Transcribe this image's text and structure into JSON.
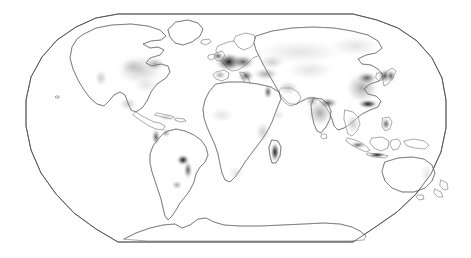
{
  "figure": {
    "type": "map",
    "title": "",
    "subtitle": "",
    "caption": "",
    "projection": "Robinson",
    "width": 471,
    "height": 258,
    "background_color": "#ffffff",
    "has_legend": false,
    "has_graticule": false,
    "has_labels": false,
    "has_title_text": false
  },
  "map": {
    "name": "world-density-map",
    "frame": {
      "stroke_color": "#4a4a4a",
      "stroke_width": 0.7,
      "fill_color": "#ffffff",
      "left_px": 24,
      "right_px": 447,
      "top_px": 14,
      "bottom_px": 242,
      "top_edge_left_px": 118,
      "top_edge_right_px": 353
    },
    "coastline": {
      "stroke_color": "#555555",
      "stroke_width": 0.55,
      "fill_color": "#ffffff"
    },
    "shading": {
      "description": "grayscale population density",
      "scale_low_color": "#e8e8e8",
      "scale_mid_color": "#b4b4b4",
      "scale_high_color": "#6e6e6e",
      "scale_max_color": "#1c1c1c"
    }
  },
  "density_regions": [
    {
      "name": "eastern-north-america",
      "level": "medium",
      "tone": "#c9c9c9"
    },
    {
      "name": "us-northeast-corridor",
      "level": "high",
      "tone": "#9a9a9a"
    },
    {
      "name": "california-coast",
      "level": "medium",
      "tone": "#cfcfcf"
    },
    {
      "name": "mexico-central",
      "level": "medium",
      "tone": "#c2c2c2"
    },
    {
      "name": "caribbean",
      "level": "medium",
      "tone": "#b8b8b8"
    },
    {
      "name": "brazil-southeast",
      "level": "very-high",
      "tone": "#2a2a2a"
    },
    {
      "name": "andes-coast-peru",
      "level": "high",
      "tone": "#4a4a4a"
    },
    {
      "name": "argentina-rio-plata",
      "level": "medium",
      "tone": "#9f9f9f"
    },
    {
      "name": "western-europe",
      "level": "very-high",
      "tone": "#262626"
    },
    {
      "name": "mediterranean-basin",
      "level": "high",
      "tone": "#6a6a6a"
    },
    {
      "name": "nile-valley",
      "level": "high",
      "tone": "#5a5a5a"
    },
    {
      "name": "west-africa-coast",
      "level": "medium",
      "tone": "#c8c8c8"
    },
    {
      "name": "east-africa-rift",
      "level": "medium",
      "tone": "#b0b0b0"
    },
    {
      "name": "madagascar",
      "level": "very-high",
      "tone": "#303030"
    },
    {
      "name": "south-africa",
      "level": "medium",
      "tone": "#bdbdbd"
    },
    {
      "name": "russia-steppe-belt",
      "level": "low",
      "tone": "#dcdcdc"
    },
    {
      "name": "middle-east",
      "level": "medium",
      "tone": "#c5c5c5"
    },
    {
      "name": "indian-subcontinent",
      "level": "high",
      "tone": "#8f8f8f"
    },
    {
      "name": "ganges-plain",
      "level": "very-high",
      "tone": "#3a3a3a"
    },
    {
      "name": "eastern-china",
      "level": "high",
      "tone": "#707070"
    },
    {
      "name": "south-china-coast",
      "level": "very-high",
      "tone": "#1f1f1f"
    },
    {
      "name": "korea-japan",
      "level": "high",
      "tone": "#5c5c5c"
    },
    {
      "name": "indochina",
      "level": "medium",
      "tone": "#a8a8a8"
    },
    {
      "name": "java-indonesia",
      "level": "very-high",
      "tone": "#2e2e2e"
    },
    {
      "name": "philippines",
      "level": "high",
      "tone": "#4f4f4f"
    },
    {
      "name": "australia-east-coast",
      "level": "low",
      "tone": "#d8d8d8"
    },
    {
      "name": "new-zealand",
      "level": "medium",
      "tone": "#8a8a8a"
    }
  ],
  "continents": [
    {
      "name": "north-america"
    },
    {
      "name": "south-america"
    },
    {
      "name": "europe"
    },
    {
      "name": "africa"
    },
    {
      "name": "asia"
    },
    {
      "name": "australia"
    },
    {
      "name": "antarctica"
    },
    {
      "name": "greenland"
    }
  ]
}
